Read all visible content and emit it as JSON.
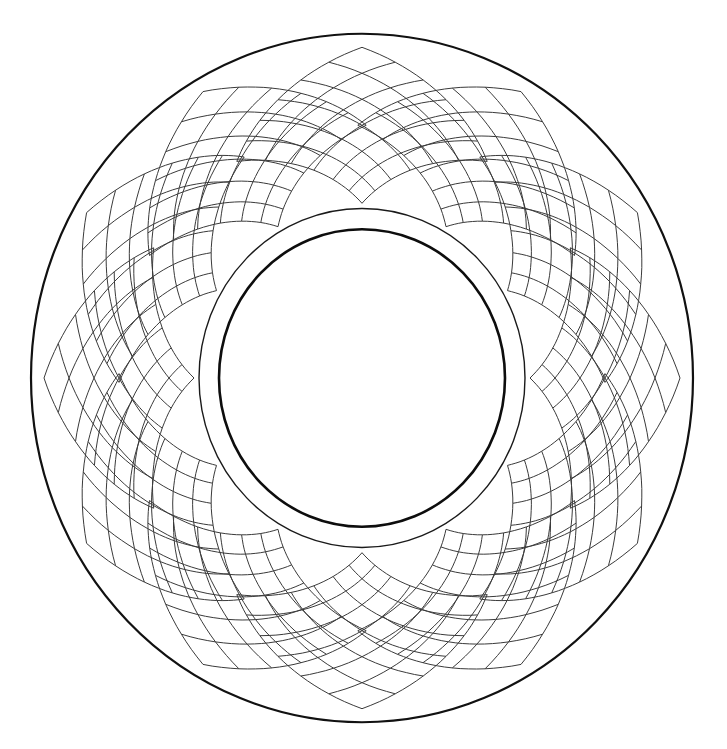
{
  "figure": {
    "background": "#ffffff",
    "center": {
      "x": 362,
      "y": 378
    },
    "aspect_y": 1.04,
    "rings": [
      {
        "name": "outer-ring",
        "r": 331,
        "stroke": "#111111",
        "width": 2.2
      },
      {
        "name": "middle-ring",
        "r": 163,
        "stroke": "#1a1a1a",
        "width": 1.4
      },
      {
        "name": "inner-ring",
        "r": 143,
        "stroke": "#0d0d0d",
        "width": 2.6
      }
    ],
    "lattice": {
      "stroke": "#3a3a3a",
      "width": 1,
      "petals": 12,
      "grid_divisions": 6,
      "inner_radius": 168,
      "outer_radius": 318,
      "angular_span_deg": 62,
      "start_angle_deg": -90
    }
  }
}
